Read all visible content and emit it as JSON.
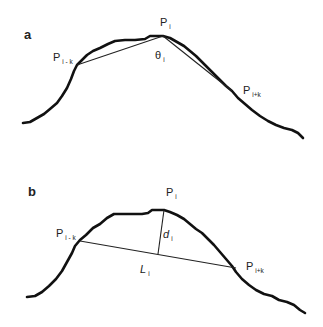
{
  "panels": [
    {
      "id": "a",
      "label": "a",
      "points": {
        "p_i": {
          "main": "P",
          "sub": "i"
        },
        "p_i_minus_k": {
          "main": "P",
          "sub": "i - k"
        },
        "p_i_plus_k": {
          "main": "P",
          "sub": "i+k"
        }
      },
      "angle": {
        "main": "θ",
        "sub": "i"
      }
    },
    {
      "id": "b",
      "label": "b",
      "points": {
        "p_i": {
          "main": "P",
          "sub": "i"
        },
        "p_i_minus_k": {
          "main": "P",
          "sub": "i - k"
        },
        "p_i_plus_k": {
          "main": "P",
          "sub": "i+k"
        }
      },
      "distance": {
        "main": "d",
        "sub": "i"
      },
      "chord": {
        "main": "L",
        "sub": "i"
      }
    }
  ],
  "colors": {
    "curve": "#111111",
    "line": "#222222",
    "background": "#ffffff"
  }
}
